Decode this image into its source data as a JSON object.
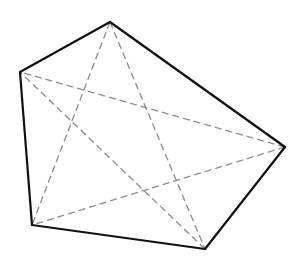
{
  "diagram": {
    "type": "pentagon-with-diagonals",
    "vertices": [
      {
        "id": "A",
        "x": 110,
        "y": 22
      },
      {
        "id": "B",
        "x": 285,
        "y": 147
      },
      {
        "id": "C",
        "x": 205,
        "y": 249
      },
      {
        "id": "D",
        "x": 32,
        "y": 225
      },
      {
        "id": "E",
        "x": 20,
        "y": 72
      }
    ],
    "edges": [
      [
        "A",
        "B"
      ],
      [
        "B",
        "C"
      ],
      [
        "C",
        "D"
      ],
      [
        "D",
        "E"
      ],
      [
        "E",
        "A"
      ]
    ],
    "diagonals": [
      [
        "A",
        "C"
      ],
      [
        "A",
        "D"
      ],
      [
        "B",
        "D"
      ],
      [
        "B",
        "E"
      ],
      [
        "C",
        "E"
      ]
    ],
    "colors": {
      "edge": "#111111",
      "diagonal": "#8c8c8c",
      "background": "#ffffff"
    }
  }
}
